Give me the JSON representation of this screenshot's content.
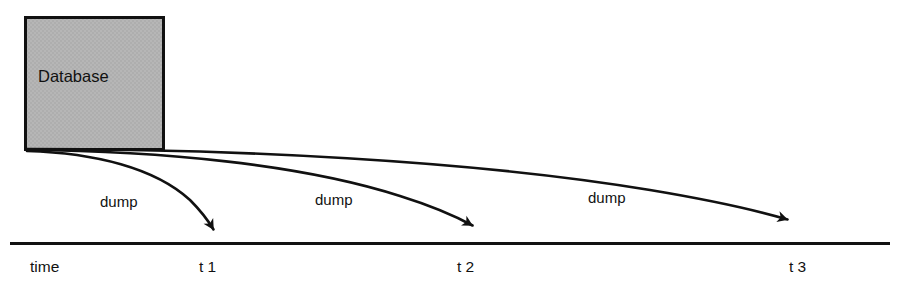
{
  "diagram": {
    "type": "timeline-diagram",
    "colors": {
      "box_fill": "#b3b3b3",
      "box_stroke": "#111111",
      "line": "#111111",
      "text": "#111111",
      "background": "#ffffff"
    },
    "source_node": {
      "label": "Database",
      "shape": "rectangle",
      "x": 25,
      "y": 17,
      "width": 138,
      "height": 133
    },
    "axis": {
      "name": "time",
      "orientation": "horizontal",
      "x_start": 10,
      "x_end": 890,
      "y": 243,
      "ticks": [
        {
          "label": "t 1",
          "x": 213
        },
        {
          "label": "t 2",
          "x": 470
        },
        {
          "label": "t 3",
          "x": 803
        }
      ]
    },
    "arrows": [
      {
        "label": "dump",
        "label_x": 100,
        "label_y": 207,
        "target_tick": "t 1",
        "tip_x": 217,
        "tip_y": 234
      },
      {
        "label": "dump",
        "label_x": 315,
        "label_y": 205,
        "target_tick": "t 2",
        "tip_x": 476,
        "tip_y": 229
      },
      {
        "label": "dump",
        "label_x": 588,
        "label_y": 203,
        "target_tick": "t 3",
        "tip_x": 791,
        "tip_y": 223
      }
    ]
  }
}
